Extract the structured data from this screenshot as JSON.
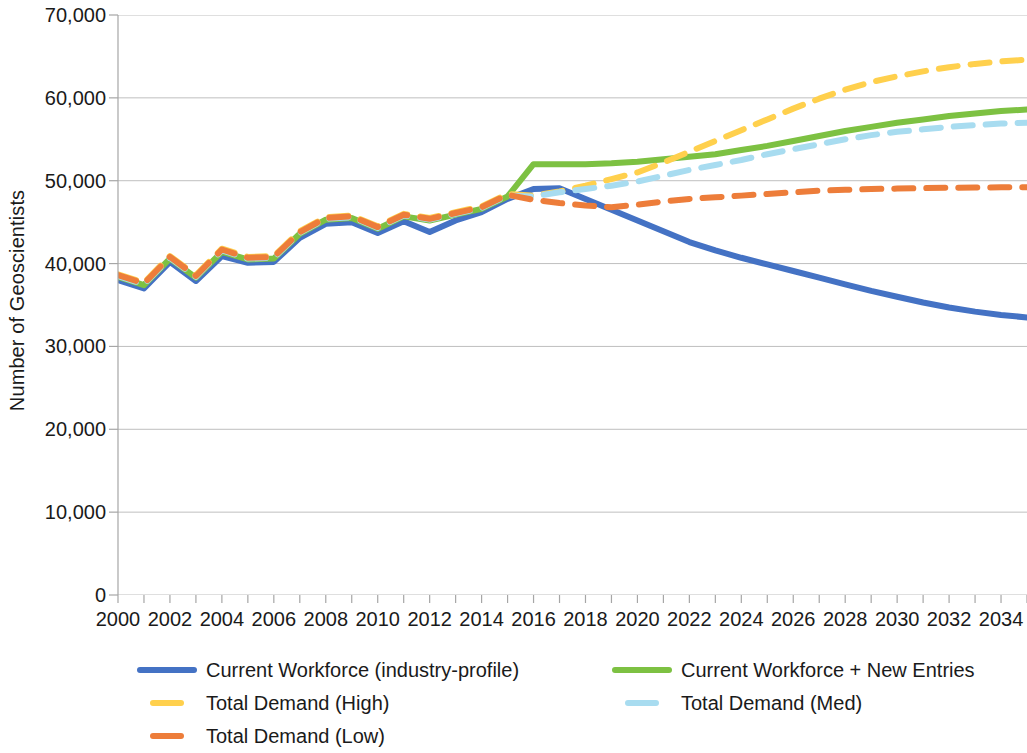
{
  "chart_data": {
    "type": "line",
    "title": "",
    "xlabel": "",
    "ylabel": "Number of Geoscientists",
    "xlim": [
      2000,
      2035
    ],
    "ylim": [
      0,
      70000
    ],
    "grid": "horizontal",
    "legend_position": "bottom",
    "y_ticks": [
      0,
      10000,
      20000,
      30000,
      40000,
      50000,
      60000,
      70000
    ],
    "y_tick_labels": [
      "0",
      "10,000",
      "20,000",
      "30,000",
      "40,000",
      "50,000",
      "60,000",
      "70,000"
    ],
    "x_ticks": [
      2000,
      2001,
      2002,
      2003,
      2004,
      2005,
      2006,
      2007,
      2008,
      2009,
      2010,
      2011,
      2012,
      2013,
      2014,
      2015,
      2016,
      2017,
      2018,
      2019,
      2020,
      2021,
      2022,
      2023,
      2024,
      2025,
      2026,
      2027,
      2028,
      2029,
      2030,
      2031,
      2032,
      2033,
      2034,
      2035
    ],
    "x_tick_labels": [
      "2000",
      "",
      "2002",
      "",
      "2004",
      "",
      "2006",
      "",
      "2008",
      "",
      "2010",
      "",
      "2012",
      "",
      "2014",
      "",
      "2016",
      "",
      "2018",
      "",
      "2020",
      "",
      "2022",
      "",
      "2024",
      "",
      "2026",
      "",
      "2028",
      "",
      "2030",
      "",
      "2032",
      "",
      "2034",
      ""
    ],
    "x": [
      2000,
      2001,
      2002,
      2003,
      2004,
      2005,
      2006,
      2007,
      2008,
      2009,
      2010,
      2011,
      2012,
      2013,
      2014,
      2015,
      2016,
      2017,
      2018,
      2019,
      2020,
      2021,
      2022,
      2023,
      2024,
      2025,
      2026,
      2027,
      2028,
      2029,
      2030,
      2031,
      2032,
      2033,
      2034,
      2035
    ],
    "series": [
      {
        "name": "Current Workforce (industry-profile)",
        "color": "#4472C4",
        "style": "solid",
        "width": 6,
        "values": [
          38000,
          37000,
          40200,
          37900,
          40900,
          40100,
          40200,
          43100,
          44800,
          45000,
          43700,
          45100,
          43800,
          45200,
          46200,
          47800,
          49000,
          49100,
          47800,
          46500,
          45200,
          43900,
          42600,
          41600,
          40700,
          39900,
          39100,
          38300,
          37500,
          36700,
          36000,
          35300,
          34700,
          34200,
          33800,
          33500
        ]
      },
      {
        "name": "Current Workforce + New Entries",
        "color": "#7DC142",
        "style": "solid",
        "width": 6,
        "values": [
          38400,
          37400,
          40600,
          38300,
          41400,
          40500,
          40600,
          43600,
          45300,
          45500,
          44200,
          45700,
          45200,
          45900,
          46600,
          48100,
          52000,
          52000,
          52000,
          52100,
          52300,
          52600,
          52900,
          53200,
          53700,
          54200,
          54800,
          55400,
          56000,
          56500,
          57000,
          57400,
          57800,
          58100,
          58400,
          58600
        ]
      },
      {
        "name": "Total Demand (High)",
        "color": "#FFD04D",
        "style": "dashed",
        "width": 6,
        "values": [
          38700,
          37700,
          40900,
          38600,
          41800,
          40800,
          40900,
          43900,
          45600,
          45800,
          44500,
          46000,
          45500,
          46200,
          46900,
          48400,
          48200,
          48700,
          49400,
          50200,
          51000,
          52200,
          53500,
          54800,
          56100,
          57400,
          58700,
          59900,
          61000,
          61900,
          62600,
          63200,
          63700,
          64100,
          64400,
          64600
        ]
      },
      {
        "name": "Total Demand (Med)",
        "color": "#A8DCF0",
        "style": "dashed",
        "width": 6,
        "values": [
          38500,
          37500,
          40700,
          38400,
          41600,
          40600,
          40700,
          43700,
          45400,
          45600,
          44300,
          45800,
          45300,
          46000,
          46700,
          48200,
          48100,
          48600,
          49000,
          49400,
          49900,
          50600,
          51300,
          51900,
          52500,
          53200,
          53800,
          54400,
          55000,
          55500,
          55900,
          56200,
          56500,
          56700,
          56900,
          57000
        ]
      },
      {
        "name": "Total Demand (Low)",
        "color": "#ED7D3A",
        "style": "dashed",
        "width": 6,
        "values": [
          38600,
          37600,
          40800,
          38500,
          41700,
          40700,
          40800,
          43800,
          45500,
          45700,
          44400,
          45900,
          45400,
          46100,
          46800,
          48300,
          47700,
          47300,
          47000,
          46800,
          47100,
          47500,
          47800,
          48000,
          48200,
          48400,
          48600,
          48800,
          48900,
          49000,
          49050,
          49100,
          49150,
          49180,
          49200,
          49200
        ]
      }
    ]
  },
  "axis": {
    "y_title": "Number of Geoscientists"
  },
  "legend": {
    "items": [
      {
        "label": "Current Workforce (industry-profile)",
        "color": "#4472C4",
        "style": "solid"
      },
      {
        "label": "Current Workforce + New Entries",
        "color": "#7DC142",
        "style": "solid"
      },
      {
        "label": "Total Demand (High)",
        "color": "#FFD04D",
        "style": "dashed"
      },
      {
        "label": "Total Demand (Med)",
        "color": "#A8DCF0",
        "style": "dashed"
      },
      {
        "label": "Total Demand (Low)",
        "color": "#ED7D3A",
        "style": "dashed"
      }
    ]
  }
}
